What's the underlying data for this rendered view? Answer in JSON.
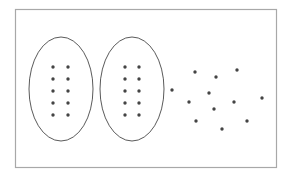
{
  "diagram": {
    "colors": {
      "background": "#ffffff",
      "frame": "#a8a8a8",
      "ellipse_stroke": "#5a5a5a",
      "dot": "#444444"
    },
    "groups": [
      {
        "name": "group-1",
        "enclosed": true,
        "dot_count": 10,
        "columns": 2,
        "rows": 5
      },
      {
        "name": "group-2",
        "enclosed": true,
        "dot_count": 10,
        "columns": 2,
        "rows": 5
      }
    ],
    "loose_dots": {
      "count": 12
    }
  }
}
